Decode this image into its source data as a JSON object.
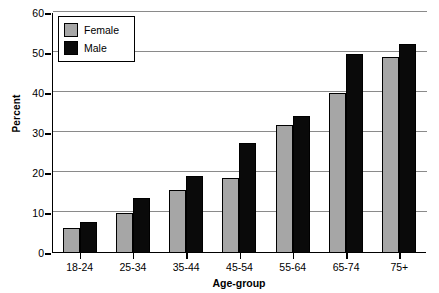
{
  "chart_data": {
    "type": "bar",
    "title": "",
    "xlabel": "Age-group",
    "ylabel": "Percent",
    "categories": [
      "18-24",
      "25-34",
      "35-44",
      "45-54",
      "55-64",
      "65-74",
      "75+"
    ],
    "series": [
      {
        "name": "Female",
        "color": "#a6a6a6",
        "values": [
          6.2,
          10.0,
          15.8,
          18.7,
          32.0,
          40.0,
          49.0
        ]
      },
      {
        "name": "Male",
        "color": "#0a0a0a",
        "values": [
          7.8,
          13.8,
          19.3,
          27.5,
          34.3,
          49.8,
          52.2
        ]
      }
    ],
    "ylim": [
      0,
      60
    ],
    "yticks": [
      0,
      10,
      20,
      30,
      40,
      50,
      60
    ],
    "ytick_labels": [
      "0",
      "10",
      "20",
      "30",
      "40",
      "50",
      "60"
    ],
    "grid": true,
    "grid_axis": "y",
    "legend_position": "top-left",
    "bar_border_color": "#000000"
  },
  "legend": {
    "entries": [
      {
        "label": "Female",
        "swatch": "female-swatch"
      },
      {
        "label": "Male",
        "swatch": "male-swatch"
      }
    ]
  },
  "axes": {
    "y_title": "Percent",
    "x_title": "Age-group"
  }
}
